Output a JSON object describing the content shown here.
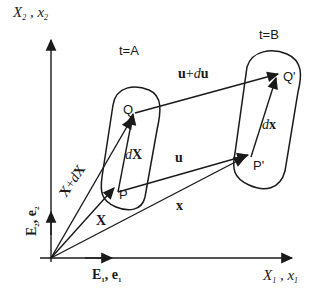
{
  "axes": {
    "vertical_label_main": "X",
    "vertical_label_main_sub": "2",
    "vertical_label_sep": " , ",
    "vertical_label_alt": "x",
    "vertical_label_alt_sub": "2",
    "horizontal_label_main": "X",
    "horizontal_label_main_sub": "1",
    "horizontal_label_sep": " , ",
    "horizontal_label_alt": "x",
    "horizontal_label_alt_sub": "1"
  },
  "basis": {
    "e1_label": "E",
    "e1_sub": "1",
    "e1_sep": ", ",
    "e1_alt": "e",
    "e1_alt_sub": "1",
    "e2_label": "E",
    "e2_sub": "2",
    "e2_sep": ", ",
    "e2_alt": "e",
    "e2_alt_sub": "2"
  },
  "configurations": {
    "reference_time": "t=A",
    "current_time": "t=B"
  },
  "points": {
    "P": "P",
    "Q": "Q",
    "P_prime": "P'",
    "Q_prime": "Q'"
  },
  "vectors": {
    "X": "X",
    "X_plus_dX_bold1": "X",
    "X_plus_dX_plus": "+",
    "X_plus_dX_d": "d",
    "X_plus_dX_bold2": "X",
    "dX_d": "d",
    "dX_bold": "X",
    "u": "u",
    "u_plus_du_bold1": "u",
    "u_plus_du_plus": "+",
    "u_plus_du_d": "d",
    "u_plus_du_bold2": "u",
    "x": "x",
    "dx_d": "d",
    "dx_bold": "x"
  }
}
